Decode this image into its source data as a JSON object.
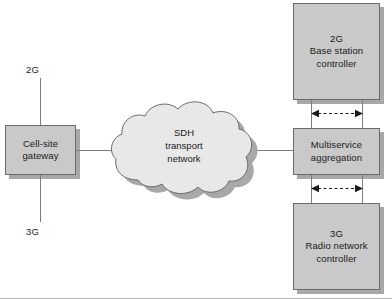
{
  "diagram": {
    "colors": {
      "box_fill": "#c9c9c9",
      "box_border": "#6b6b6b",
      "cloud_fill": "#e8e8e8",
      "cloud_border": "#6b6b6b",
      "shadow": "#a8a8a8",
      "line": "#7d7d7d",
      "text": "#1a1a1a"
    },
    "nodes": {
      "cell_site_gateway": {
        "label_line1": "Cell-site",
        "label_line2": "gateway",
        "shape": "rectangle"
      },
      "sdh_cloud": {
        "label_line1": "SDH",
        "label_line2": "transport",
        "label_line3": "network",
        "shape": "cloud"
      },
      "bsc_2g": {
        "label_line1": "2G",
        "label_line2": "Base station",
        "label_line3": "controller",
        "shape": "rectangle"
      },
      "multiservice_aggregation": {
        "label_line1": "Multiservice",
        "label_line2": "aggregation",
        "shape": "rectangle"
      },
      "rnc_3g": {
        "label_line1": "3G",
        "label_line2": "Radio network",
        "label_line3": "controller",
        "shape": "rectangle"
      }
    },
    "endpoints": {
      "access_2g": "2G",
      "access_3g": "3G"
    },
    "connections": [
      {
        "from": "access_2g",
        "to": "cell_site_gateway",
        "style": "solid"
      },
      {
        "from": "access_3g",
        "to": "cell_site_gateway",
        "style": "solid"
      },
      {
        "from": "cell_site_gateway",
        "to": "sdh_cloud",
        "style": "solid"
      },
      {
        "from": "sdh_cloud",
        "to": "multiservice_aggregation",
        "style": "solid"
      },
      {
        "from": "bsc_2g",
        "to": "multiservice_aggregation",
        "style": "solid-pair"
      },
      {
        "from": "multiservice_aggregation",
        "to": "rnc_3g",
        "style": "solid-pair"
      },
      {
        "from": "bsc_2g",
        "to": "multiservice_aggregation",
        "style": "dashed-bidirectional"
      },
      {
        "from": "multiservice_aggregation",
        "to": "rnc_3g",
        "style": "dashed-bidirectional"
      }
    ]
  }
}
